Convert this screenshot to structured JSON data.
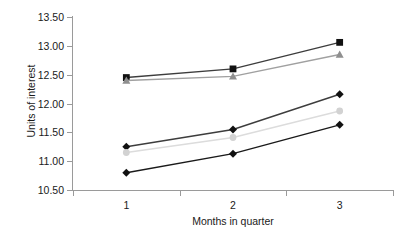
{
  "chart_data": {
    "type": "line",
    "title": "",
    "subtitle": "",
    "xlabel": "Months in quarter",
    "ylabel": "Units of interest",
    "categories": [
      "1",
      "2",
      "3"
    ],
    "x": [
      1,
      2,
      3
    ],
    "ylim": [
      10.5,
      13.5
    ],
    "ytick_labels": [
      "13.50",
      "13.00",
      "12.50",
      "12.00",
      "11.50",
      "11.00",
      "10.50"
    ],
    "ytick_values": [
      13.5,
      13.0,
      12.5,
      12.0,
      11.5,
      11.0,
      10.5
    ],
    "ytick_step": 0.5,
    "grid": false,
    "legend": false,
    "legend_position": "none",
    "background": "#ffffff",
    "axis_color": "#9a9a9a",
    "series": [
      {
        "name": "series-1-black-square",
        "marker": "square",
        "marker_color": "#111111",
        "line_color": "#3d3d3d",
        "values": [
          12.45,
          12.6,
          13.06
        ]
      },
      {
        "name": "series-2-gray-triangle",
        "marker": "triangle",
        "marker_color": "#8f8f8f",
        "line_color": "#a0a0a0",
        "values": [
          12.4,
          12.47,
          12.85
        ]
      },
      {
        "name": "series-3-black-diamond-upper",
        "marker": "diamond",
        "marker_color": "#111111",
        "line_color": "#3d3d3d",
        "values": [
          11.25,
          11.55,
          12.16
        ]
      },
      {
        "name": "series-4-lightgray-circle",
        "marker": "circle",
        "marker_color": "#d2d2d2",
        "line_color": "#dcdcdc",
        "values": [
          11.15,
          11.41,
          11.87
        ]
      },
      {
        "name": "series-5-black-diamond-lower",
        "marker": "diamond",
        "marker_color": "#111111",
        "line_color": "#1a1a1a",
        "values": [
          10.8,
          11.13,
          11.63
        ]
      }
    ]
  }
}
